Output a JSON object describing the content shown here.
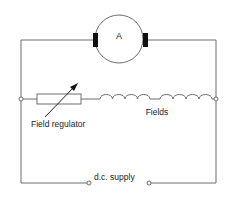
{
  "diagram": {
    "type": "circuit",
    "components": {
      "armature": {
        "label": "A",
        "center": [
          119,
          39
        ],
        "radius": 24
      },
      "field_regulator": {
        "label": "Field regulator",
        "type": "variable-resistor"
      },
      "fields": {
        "label": "Fields",
        "type": "inductor-coils",
        "coil_groups": 2,
        "turns_per_group": 4
      },
      "supply": {
        "label": "d.c. supply",
        "type": "terminals"
      }
    },
    "colors": {
      "wire": "#6e6e6e",
      "brush": "#111111",
      "text": "#222222",
      "background": "#ffffff"
    }
  }
}
